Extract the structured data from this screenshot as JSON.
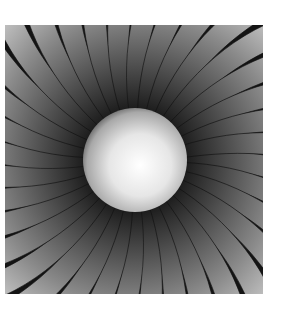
{
  "image": {
    "description": "Grayscale pinwheel of curved blades radiating from a glowing central sphere",
    "palette": {
      "background": "#ffffff",
      "dark": "#141414",
      "blade_light": "#d8d8d8",
      "center_highlight": "#ffffff",
      "center_edge": "#6e6e6e"
    },
    "blade_count": 36,
    "center": {
      "cx": 130,
      "cy": 135,
      "r": 52
    }
  }
}
